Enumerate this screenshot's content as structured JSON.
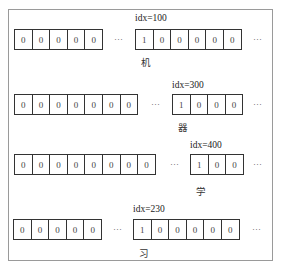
{
  "diagram": {
    "ellipsis": "···",
    "rows": [
      {
        "idx_label": "idx=100",
        "char": "机",
        "left_cells": [
          "0",
          "0",
          "0",
          "0",
          "0"
        ],
        "right_cells": [
          "1",
          "0",
          "0",
          "0",
          "0",
          "0"
        ]
      },
      {
        "idx_label": "idx=300",
        "char": "器",
        "left_cells": [
          "0",
          "0",
          "0",
          "0",
          "0",
          "0",
          "0"
        ],
        "right_cells": [
          "1",
          "0",
          "0",
          "0"
        ]
      },
      {
        "idx_label": "idx=400",
        "char": "学",
        "left_cells": [
          "0",
          "0",
          "0",
          "0",
          "0",
          "0",
          "0",
          "0"
        ],
        "right_cells": [
          "1",
          "0",
          "0"
        ]
      },
      {
        "idx_label": "idx=230",
        "char": "习",
        "left_cells": [
          "0",
          "0",
          "0",
          "0",
          "0"
        ],
        "right_cells": [
          "1",
          "0",
          "0",
          "0",
          "0",
          "0"
        ]
      }
    ]
  }
}
